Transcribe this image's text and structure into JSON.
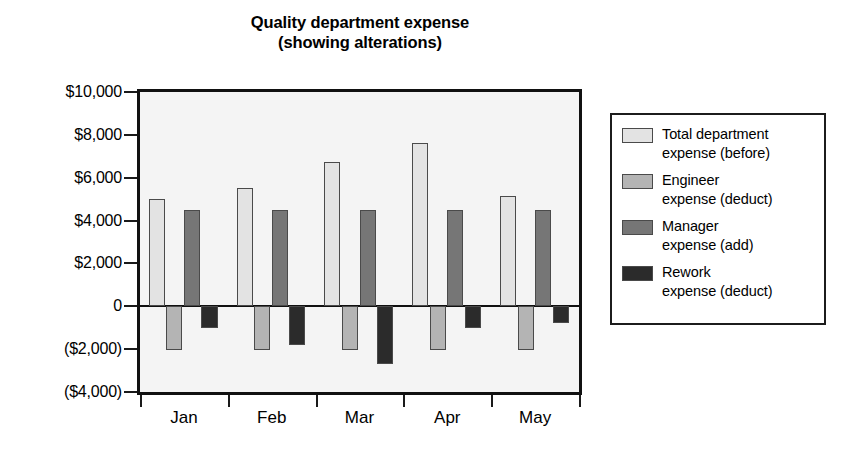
{
  "chart_data": {
    "type": "bar",
    "title": "Quality department expense\n(showing alterations)",
    "title_lines": [
      "Quality department expense",
      "(showing alterations)"
    ],
    "xlabel": "",
    "ylabel": "",
    "categories": [
      "Jan",
      "Feb",
      "Mar",
      "Apr",
      "May"
    ],
    "ylim": [
      -4000,
      10000
    ],
    "ytick_values": [
      10000,
      8000,
      6000,
      4000,
      2000,
      0,
      -2000,
      -4000
    ],
    "ytick_labels": [
      "$10,000",
      "$8,000",
      "$6,000",
      "$4,000",
      "$2,000",
      "0",
      "($2,000)",
      "($4,000)"
    ],
    "grid": false,
    "legend_position": "right",
    "series": [
      {
        "name": "Total department expense (before)",
        "name_lines": [
          "Total department",
          "expense (before)"
        ],
        "color": "#e3e3e3",
        "values": [
          5000,
          5500,
          6750,
          7600,
          5150
        ]
      },
      {
        "name": "Engineer expense (deduct)",
        "name_lines": [
          "Engineer",
          "expense (deduct)"
        ],
        "color": "#b4b4b4",
        "values": [
          -2050,
          -2050,
          -2050,
          -2050,
          -2050
        ]
      },
      {
        "name": "Manager expense (add)",
        "name_lines": [
          "Manager",
          "expense (add)"
        ],
        "color": "#767676",
        "values": [
          4500,
          4500,
          4500,
          4500,
          4500
        ]
      },
      {
        "name": "Rework expense (deduct)",
        "name_lines": [
          "Rework",
          "expense (deduct)"
        ],
        "color": "#2b2b2b",
        "values": [
          -1000,
          -1800,
          -2700,
          -1000,
          -800
        ]
      }
    ]
  }
}
